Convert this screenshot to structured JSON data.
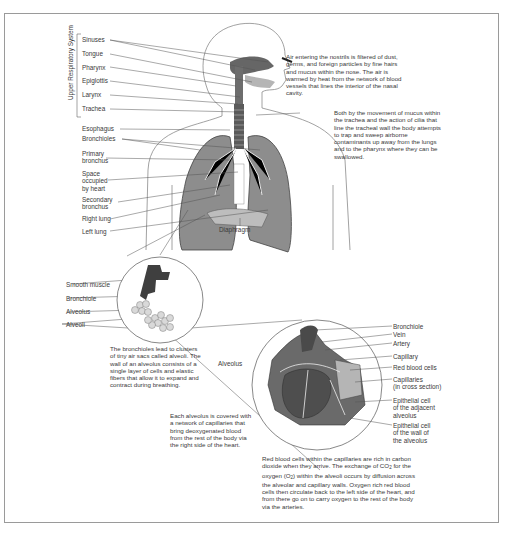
{
  "diagram": {
    "group_label": "Upper Respiratory System",
    "upper_labels": [
      "Sinuses",
      "Tongue",
      "Pharynx",
      "Epiglottis",
      "Larynx",
      "Trachea"
    ],
    "left_labels": [
      {
        "text": "Esophagus"
      },
      {
        "text": "Bronchioles"
      },
      {
        "text": "Primary\nbronchus"
      },
      {
        "text": "Space\noccupied\nby heart"
      },
      {
        "text": "Secondary\nbronchus"
      },
      {
        "text": "Right lung"
      },
      {
        "text": "Left lung"
      }
    ],
    "diaphragm_label": "Diaphragm",
    "nasal_note": "Air entering the nostrils is filtered of dust, germs, and foreign particles by fine hairs and mucus within the nose. The air is warmed by heat from the network of blood vessels that lines the interior of the nasal cavity.",
    "trachea_note": "Both by the movement of mucus within the trachea and the action of cilia that line the tracheal wall the body attempts to trap and sweep airborne contaminants up away from the lungs and to the pharynx where they can be swallowed.",
    "inset1_labels": [
      "Smooth muscle",
      "Bronchiole",
      "Alveolus",
      "Alveoli"
    ],
    "bronchiole_note": "The bronchioles lead to clusters of tiny air sacs called alveoli. The wall of an alveolus consists of a single layer of cells and elastic fibers that allow it to expand and contract during breathing.",
    "alveolus_note": "Each alveolus is covered with a network of capillaries that bring deoxygenated blood from the rest of the body via the right side of the heart.",
    "inset2_left_label": "Alveolus",
    "inset2_labels": [
      "Bronchiole",
      "Vein",
      "Artery",
      "Capillary",
      "Red blood cells",
      "Capillaries\n(in cross section)",
      "Epithelial cell\nof the adjacent\nalveolus",
      "Epithelial cell\nof the wall of\nthe alveolus"
    ],
    "exchange_note_parts": {
      "a": "Red blood cells within the capillaries are rich in carbon dioxide when they arrive. The exchange of CO",
      "sub1": "2",
      "b": " for the oxygen (O",
      "sub2": "2",
      "c": ") within the alveoli occurs by diffusion across the alveolar and capillary walls. Oxygen rich red blood cells then circulate back to the left side of the heart, and from there go on to carry oxygen to the rest of the body via the arteries."
    },
    "colors": {
      "tissue": "#5a5a5a",
      "tissue_light": "#a9a9a9",
      "line": "#4a4a4a",
      "frame": "#9a9a9a"
    }
  }
}
